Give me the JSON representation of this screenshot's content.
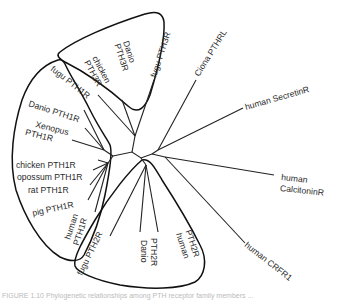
{
  "figure": {
    "type": "unrooted phylogenetic tree",
    "caption": "FIGURE 1.10 Phylogenetic relationships among PTH receptor family members ..."
  },
  "clades": [
    {
      "name": "PTH3R",
      "members": [
        "Danio PTH3R",
        "chicken PTH3R",
        "fugu PTH3R"
      ]
    },
    {
      "name": "PTH1R",
      "members": [
        "fugu PTH1R",
        "Danio PTH1R",
        "Xenopus PTH1R",
        "chicken PTH1R",
        "opossum PTH1R",
        "rat PTH1R",
        "pig PTH1R",
        "human PTH1R"
      ]
    },
    {
      "name": "PTH2R",
      "members": [
        "fugu PTH2R",
        "Danio PTH2R",
        "human PTH2R"
      ]
    }
  ],
  "outgroups": [
    "Ciona PTHRL",
    "human SecretinR",
    "human CalcitoninR",
    "human CRFR1"
  ],
  "labels": {
    "danio_pth3r_1": "Danio",
    "danio_pth3r_2": "PTH3R",
    "chicken_pth3r_1": "chicken",
    "chicken_pth3r_2": "PTH3R",
    "fugu_pth3r": "fugu PTH3R",
    "ciona": "Ciona PTHRL",
    "secretin": "human SecretinR",
    "calcitonin_1": "human",
    "calcitonin_2": "CalcitoninR",
    "crfr1": "human CRFR1",
    "fugu_pth1r": "fugu PTH1R",
    "danio_pth1r": "Danio PTH1R",
    "xenopus_1": "Xenopus",
    "xenopus_2": "PTH1R",
    "chicken_pth1r": "chicken PTH1R",
    "opossum_pth1r": "opossum PTH1R",
    "rat_pth1r": "rat PTH1R",
    "pig_pth1r": "pig PTH1R",
    "human_pth1r_1": "human",
    "human_pth1r_2": "PTH1R",
    "fugu_pth2r": "fugu PTH2R",
    "danio_pth2r_1": "Danio",
    "danio_pth2r_2": "PTH2R",
    "human_pth2r_1": "human",
    "human_pth2r_2": "PTH2R"
  }
}
